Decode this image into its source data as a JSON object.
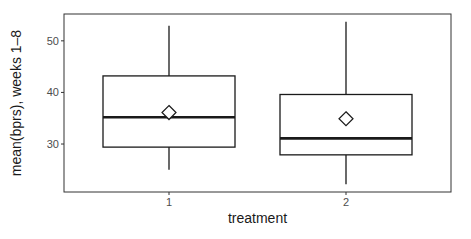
{
  "chart_data": {
    "type": "boxplot",
    "title": "",
    "xlabel": "treatment",
    "ylabel": "mean(bprs), weeks 1–8",
    "categories": [
      "1",
      "2"
    ],
    "yticks": [
      30,
      40,
      50
    ],
    "ylim": [
      20.7,
      55.2
    ],
    "grid": false,
    "legend": null,
    "series": [
      {
        "name": "1",
        "whisker_low": 25.0,
        "q1": 29.4,
        "median": 35.2,
        "q3": 43.2,
        "whisker_high": 52.9,
        "mean": 36.1
      },
      {
        "name": "2",
        "whisker_low": 22.2,
        "q1": 27.9,
        "median": 31.1,
        "q3": 39.6,
        "whisker_high": 53.7,
        "mean": 34.9
      }
    ],
    "mean_marker": "open-diamond"
  },
  "colors": {
    "panel_border": "#333333",
    "box_line": "#1a1a1a",
    "tick_text": "#4d4d4d",
    "axis_title": "#1a1a1a",
    "background": "#ffffff"
  }
}
